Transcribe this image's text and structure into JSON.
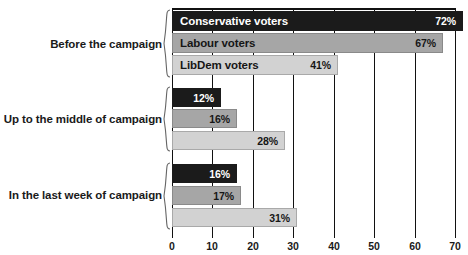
{
  "chart_data": {
    "type": "bar",
    "orientation": "horizontal",
    "title": "",
    "subtitle": "",
    "xlabel": "",
    "ylabel": "",
    "xlim": [
      0,
      70
    ],
    "xticks": [
      0,
      10,
      20,
      30,
      40,
      50,
      60,
      70
    ],
    "xtick_labels": [
      "0",
      "10",
      "20",
      "30",
      "40",
      "50",
      "60",
      "70"
    ],
    "grid": true,
    "grid_axis": "x",
    "legend": "in-bar",
    "value_suffix": "%",
    "series": [
      {
        "name": "Conservative voters",
        "key": "conservative",
        "color": "#1b1b1b",
        "values": [
          72,
          12,
          16
        ]
      },
      {
        "name": "Labour voters",
        "key": "labour",
        "color": "#a6a6a6",
        "values": [
          67,
          16,
          17
        ]
      },
      {
        "name": "LibDem voters",
        "key": "libdem",
        "color": "#d2d2d2",
        "values": [
          41,
          28,
          31
        ]
      }
    ],
    "categories": [
      "Before the campaign",
      "Up to the middle of campaign",
      "In the last week of campaign"
    ],
    "groups": [
      {
        "label": "Before the campaign",
        "bars": [
          {
            "series": "Conservative voters",
            "value": 72,
            "value_label": "72%",
            "show_series_label": true
          },
          {
            "series": "Labour voters",
            "value": 67,
            "value_label": "67%",
            "show_series_label": true
          },
          {
            "series": "LibDem voters",
            "value": 41,
            "value_label": "41%",
            "show_series_label": true
          }
        ]
      },
      {
        "label": "Up to the middle of campaign",
        "bars": [
          {
            "series": "Conservative voters",
            "value": 12,
            "value_label": "12%",
            "show_series_label": false
          },
          {
            "series": "Labour voters",
            "value": 16,
            "value_label": "16%",
            "show_series_label": false
          },
          {
            "series": "LibDem voters",
            "value": 28,
            "value_label": "28%",
            "show_series_label": false
          }
        ]
      },
      {
        "label": "In the last week of campaign",
        "bars": [
          {
            "series": "Conservative voters",
            "value": 16,
            "value_label": "16%",
            "show_series_label": false
          },
          {
            "series": "Labour voters",
            "value": 17,
            "value_label": "17%",
            "show_series_label": false
          },
          {
            "series": "LibDem voters",
            "value": 31,
            "value_label": "31%",
            "show_series_label": false
          }
        ]
      }
    ]
  },
  "colors": {
    "conservative": "#1b1b1b",
    "labour": "#a6a6a6",
    "libdem": "#d2d2d2",
    "axis": "#111111",
    "background": "#ffffff",
    "text": "#1a1a1a"
  },
  "axis": {
    "ticks": [
      "0",
      "10",
      "20",
      "30",
      "40",
      "50",
      "60",
      "70"
    ]
  },
  "labels": {
    "group1": "Before the campaign",
    "group2": "Up to the middle of campaign",
    "group3": "In the last week of campaign",
    "series1": "Conservative voters",
    "series2": "Labour voters",
    "series3": "LibDem voters"
  },
  "values": {
    "g1s1": "72%",
    "g1s2": "67%",
    "g1s3": "41%",
    "g2s1": "12%",
    "g2s2": "16%",
    "g2s3": "28%",
    "g3s1": "16%",
    "g3s2": "17%",
    "g3s3": "31%"
  }
}
